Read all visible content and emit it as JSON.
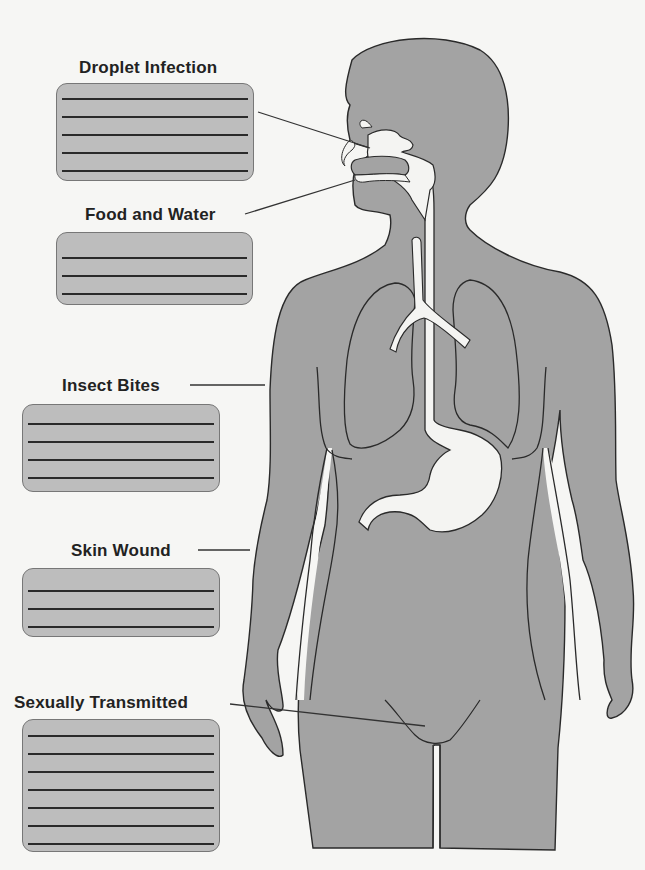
{
  "diagram": {
    "type": "worksheet",
    "colors": {
      "background": "#f6f6f4",
      "body_fill": "#a3a3a3",
      "organ_fill": "#f4f4f2",
      "outline": "#2a2a2a",
      "answer_box_fill": "#bdbdbd"
    },
    "routes": [
      {
        "id": "droplet",
        "label": "Droplet Infection",
        "answer_lines": 5,
        "points_to": "nose"
      },
      {
        "id": "food",
        "label": "Food and Water",
        "answer_lines": 3,
        "points_to": "mouth"
      },
      {
        "id": "insect",
        "label": "Insect Bites",
        "answer_lines": 4,
        "points_to": "arm skin"
      },
      {
        "id": "skin",
        "label": "Skin Wound",
        "answer_lines": 3,
        "points_to": "arm skin"
      },
      {
        "id": "sexual",
        "label": "Sexually Transmitted",
        "answer_lines": 7,
        "points_to": "genitals"
      }
    ],
    "organs_shown": [
      "nasal cavity",
      "mouth",
      "trachea",
      "bronchi",
      "lungs",
      "esophagus",
      "stomach"
    ]
  }
}
